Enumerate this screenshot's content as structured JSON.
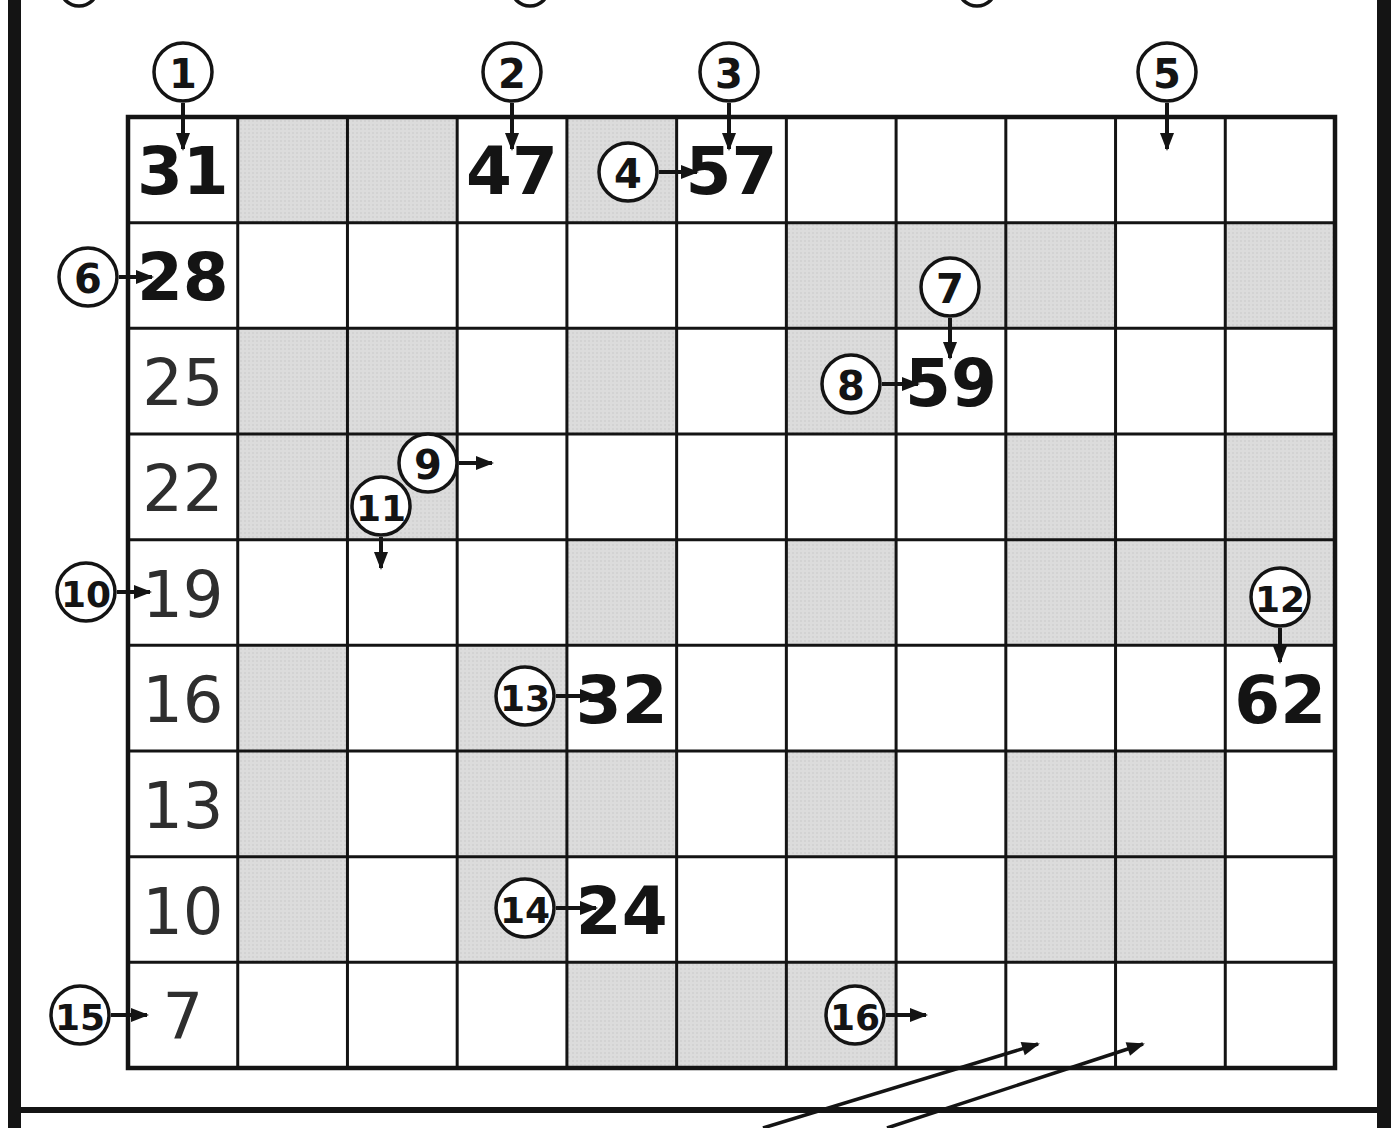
{
  "page": {
    "paper_color": "#ffffff",
    "ink_color": "#141414",
    "shade_color": "#dcdcdc",
    "shade_dot_color": "#c8c8c8"
  },
  "grid": {
    "rows": 9,
    "cols": 11,
    "shading": [
      [
        0,
        1,
        1,
        0,
        1,
        0,
        0,
        0,
        0,
        0,
        0
      ],
      [
        0,
        0,
        0,
        0,
        0,
        0,
        1,
        1,
        1,
        0,
        1
      ],
      [
        0,
        1,
        1,
        0,
        1,
        0,
        1,
        0,
        0,
        0,
        0
      ],
      [
        0,
        1,
        1,
        0,
        0,
        0,
        0,
        0,
        1,
        0,
        1
      ],
      [
        0,
        0,
        0,
        0,
        1,
        0,
        1,
        0,
        1,
        1,
        1
      ],
      [
        0,
        1,
        0,
        1,
        0,
        0,
        0,
        0,
        0,
        0,
        0
      ],
      [
        0,
        1,
        0,
        1,
        1,
        0,
        1,
        0,
        1,
        1,
        0
      ],
      [
        0,
        1,
        0,
        1,
        0,
        0,
        0,
        0,
        1,
        1,
        0
      ],
      [
        0,
        0,
        0,
        0,
        1,
        1,
        1,
        0,
        0,
        0,
        0
      ]
    ],
    "values": [
      {
        "row": 1,
        "col": 1,
        "text": "31",
        "weight": "bold"
      },
      {
        "row": 1,
        "col": 4,
        "text": "47",
        "weight": "bold"
      },
      {
        "row": 1,
        "col": 6,
        "text": "57",
        "weight": "bold"
      },
      {
        "row": 2,
        "col": 1,
        "text": "28",
        "weight": "bold"
      },
      {
        "row": 3,
        "col": 1,
        "text": "25",
        "weight": "light"
      },
      {
        "row": 3,
        "col": 8,
        "text": "59",
        "weight": "bold"
      },
      {
        "row": 4,
        "col": 1,
        "text": "22",
        "weight": "light"
      },
      {
        "row": 5,
        "col": 1,
        "text": "19",
        "weight": "light"
      },
      {
        "row": 6,
        "col": 1,
        "text": "16",
        "weight": "light"
      },
      {
        "row": 6,
        "col": 5,
        "text": "32",
        "weight": "bold"
      },
      {
        "row": 6,
        "col": 11,
        "text": "62",
        "weight": "bold"
      },
      {
        "row": 7,
        "col": 1,
        "text": "13",
        "weight": "light"
      },
      {
        "row": 8,
        "col": 1,
        "text": "10",
        "weight": "light"
      },
      {
        "row": 8,
        "col": 5,
        "text": "24",
        "weight": "bold"
      },
      {
        "row": 9,
        "col": 1,
        "text": "7",
        "weight": "light"
      }
    ]
  },
  "markers": [
    {
      "label": "1",
      "cx": 183,
      "cy": 72,
      "dir": "down",
      "len": 46
    },
    {
      "label": "2",
      "cx": 512,
      "cy": 72,
      "dir": "down",
      "len": 46
    },
    {
      "label": "3",
      "cx": 729,
      "cy": 72,
      "dir": "down",
      "len": 46
    },
    {
      "label": "4",
      "cx": 628,
      "cy": 172,
      "dir": "right",
      "len": 38
    },
    {
      "label": "5",
      "cx": 1167,
      "cy": 72,
      "dir": "down",
      "len": 46
    },
    {
      "label": "6",
      "cx": 88,
      "cy": 277,
      "dir": "right",
      "len": 33
    },
    {
      "label": "7",
      "cx": 950,
      "cy": 287,
      "dir": "down",
      "len": 40
    },
    {
      "label": "8",
      "cx": 851,
      "cy": 384,
      "dir": "right",
      "len": 36
    },
    {
      "label": "9",
      "cx": 428,
      "cy": 463,
      "dir": "right",
      "len": 33
    },
    {
      "label": "10",
      "cx": 86,
      "cy": 592,
      "dir": "right",
      "len": 33
    },
    {
      "label": "11",
      "cx": 381,
      "cy": 506,
      "dir": "down",
      "len": 31
    },
    {
      "label": "12",
      "cx": 1280,
      "cy": 597,
      "dir": "down",
      "len": 34
    },
    {
      "label": "13",
      "cx": 525,
      "cy": 696,
      "dir": "right",
      "len": 40
    },
    {
      "label": "14",
      "cx": 525,
      "cy": 908,
      "dir": "right",
      "len": 40
    },
    {
      "label": "15",
      "cx": 80,
      "cy": 1015,
      "dir": "right",
      "len": 36
    },
    {
      "label": "16",
      "cx": 855,
      "cy": 1015,
      "dir": "right",
      "len": 40
    }
  ],
  "long_arrows": [
    {
      "x1": 763,
      "y1": 1128,
      "x2": 1038,
      "y2": 1044
    },
    {
      "x1": 887,
      "y1": 1128,
      "x2": 1143,
      "y2": 1044
    }
  ],
  "top_partial_circles": [
    79,
    530,
    977
  ]
}
